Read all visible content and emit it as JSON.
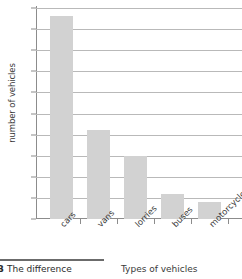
{
  "chart_data": {
    "type": "bar",
    "title": "",
    "categories": [
      "cars",
      "vans",
      "lorries",
      "buses",
      "motorcycles"
    ],
    "values": [
      48,
      21,
      15,
      6,
      4
    ],
    "xlabel": "Types of vehicles",
    "ylabel": "number of vehicles",
    "ylim": [
      0,
      50
    ],
    "ytick_step": 5,
    "yticks": [
      50,
      45,
      40,
      35,
      30,
      25,
      20,
      15,
      10,
      5,
      0
    ],
    "grid": true,
    "grid_axis": "y",
    "legend": "none",
    "bar_color": "#d2d2d2",
    "grid_color": "#b9b9b9",
    "axis_color": "#8c8c8c",
    "text_color": "#3a3a3a"
  },
  "footer": {
    "figure_number": "B",
    "caption": "The difference",
    "x_axis_title": "Types of vehicles"
  }
}
